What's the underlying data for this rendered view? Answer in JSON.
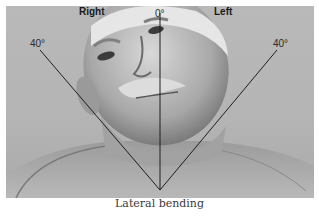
{
  "figure": {
    "labels": {
      "right": "Right",
      "left": "Left",
      "center_angle": "0°",
      "right_angle": "40°",
      "left_angle": "40°"
    },
    "caption": "Lateral bending",
    "colors": {
      "background": "#b5b5b5",
      "lines": "#1e1e1e",
      "text": "#1a1a1a",
      "caption": "#3a3a3a"
    }
  }
}
